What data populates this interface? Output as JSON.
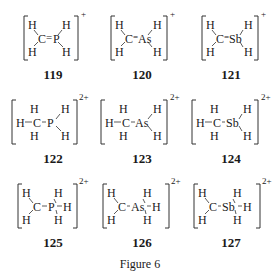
{
  "figure": {
    "caption": "Figure 6",
    "structures": [
      {
        "id": "119",
        "central": "P",
        "bond": "=",
        "charge": "+",
        "leftH": 2,
        "rightH": 2,
        "extraRightH": false
      },
      {
        "id": "120",
        "central": "As",
        "bond": "=",
        "charge": "+",
        "leftH": 2,
        "rightH": 2,
        "extraRightH": false
      },
      {
        "id": "121",
        "central": "Sb",
        "bond": "=",
        "charge": "+",
        "leftH": 2,
        "rightH": 2,
        "extraRightH": false
      },
      {
        "id": "122",
        "central": "P",
        "bond": "-",
        "charge": "2+",
        "leftH": 3,
        "rightH": 2,
        "extraRightH": false
      },
      {
        "id": "123",
        "central": "As",
        "bond": "-",
        "charge": "2+",
        "leftH": 3,
        "rightH": 2,
        "extraRightH": false
      },
      {
        "id": "124",
        "central": "Sb",
        "bond": "-",
        "charge": "2+",
        "leftH": 3,
        "rightH": 2,
        "extraRightH": false
      },
      {
        "id": "125",
        "central": "P",
        "bond": "-",
        "charge": "2+",
        "leftH": 2,
        "rightH": 3,
        "extraRightH": true
      },
      {
        "id": "126",
        "central": "As",
        "bond": "-",
        "charge": "2+",
        "leftH": 2,
        "rightH": 3,
        "extraRightH": true
      },
      {
        "id": "127",
        "central": "Sb",
        "bond": "-",
        "charge": "2+",
        "leftH": 2,
        "rightH": 3,
        "extraRightH": true
      }
    ],
    "atoms": {
      "carbon": "C",
      "hydrogen": "H"
    }
  }
}
